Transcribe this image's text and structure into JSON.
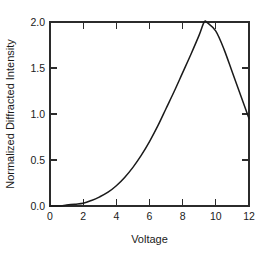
{
  "chart_data": {
    "type": "line",
    "title": "",
    "xlabel": "Voltage",
    "ylabel": "Normalized Diffracted Intensity",
    "xlim": [
      0,
      12
    ],
    "ylim": [
      0.0,
      2.0
    ],
    "xticks": [
      0,
      2,
      4,
      6,
      8,
      10,
      12
    ],
    "xticklabels": [
      "0",
      "2",
      "4",
      "6",
      "8",
      "10",
      "12"
    ],
    "yticks": [
      0.0,
      0.5,
      1.0,
      1.5,
      2.0
    ],
    "yticklabels": [
      "0.0",
      "0.5",
      "1.0",
      "1.5",
      "2.0"
    ],
    "grid": false,
    "legend": null,
    "series": [
      {
        "name": "Normalized Diffracted Intensity",
        "x": [
          0.0,
          0.5,
          1.0,
          1.5,
          2.0,
          2.5,
          3.0,
          3.5,
          4.0,
          4.5,
          5.0,
          5.5,
          6.0,
          6.5,
          7.0,
          7.5,
          8.0,
          8.5,
          9.0,
          9.3,
          9.5,
          10.0,
          10.5,
          11.0,
          11.5,
          12.0
        ],
        "values": [
          0.0,
          0.0,
          0.01,
          0.02,
          0.03,
          0.06,
          0.1,
          0.15,
          0.22,
          0.31,
          0.42,
          0.55,
          0.7,
          0.87,
          1.06,
          1.25,
          1.45,
          1.65,
          1.86,
          2.0,
          1.99,
          1.9,
          1.7,
          1.45,
          1.2,
          0.95
        ]
      }
    ],
    "annotations": []
  },
  "figure": {
    "axis_frame": "box-with-inward-ticks",
    "line_color": "#1a1a1a",
    "background_color": "#ffffff"
  }
}
